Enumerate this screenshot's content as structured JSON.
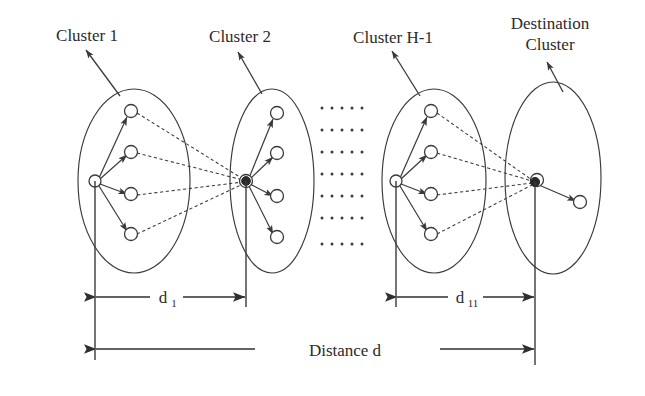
{
  "figure": {
    "width": 645,
    "height": 396,
    "background": "#ffffff",
    "ink": "#3a3a3a"
  },
  "labels": {
    "cluster1": "Cluster 1",
    "cluster2": "Cluster 2",
    "cluster_h1": "Cluster H-1",
    "destination_line1": "Destination",
    "destination_line2": "Cluster"
  },
  "dimensions": {
    "d1_base": "d",
    "d1_sub": "1",
    "d11_base": "d",
    "d11_sub": "11",
    "distance_total": "Distance d"
  },
  "ellipsis": {
    "rows": 7,
    "cols": 5,
    "glyph": "."
  },
  "clusters": [
    {
      "id": "cluster-1",
      "name": "Cluster 1",
      "kind": "source",
      "ellipse": {
        "cx": 134,
        "cy": 181,
        "rx": 56,
        "ry": 92
      },
      "hub": {
        "x": 95,
        "y": 181,
        "type": "open"
      },
      "members": [
        {
          "x": 131,
          "y": 111
        },
        {
          "x": 131,
          "y": 152
        },
        {
          "x": 131,
          "y": 194
        },
        {
          "x": 131,
          "y": 234
        }
      ],
      "ref_line": {
        "x": 95,
        "y_top": 181,
        "y_bottom": 360
      }
    },
    {
      "id": "cluster-2",
      "name": "Cluster 2",
      "kind": "relay",
      "ellipse": {
        "cx": 272,
        "cy": 181,
        "rx": 42,
        "ry": 92
      },
      "hub": {
        "x": 246,
        "y": 181,
        "type": "filled"
      },
      "members": [
        {
          "x": 277,
          "y": 113
        },
        {
          "x": 277,
          "y": 153
        },
        {
          "x": 277,
          "y": 196
        },
        {
          "x": 277,
          "y": 237
        }
      ],
      "ref_line": {
        "x": 246,
        "y_top": 181,
        "y_bottom": 307
      }
    },
    {
      "id": "cluster-h-1",
      "name": "Cluster H-1",
      "kind": "source",
      "ellipse": {
        "cx": 434,
        "cy": 181,
        "rx": 52,
        "ry": 92
      },
      "hub": {
        "x": 396,
        "y": 181,
        "type": "open"
      },
      "members": [
        {
          "x": 431,
          "y": 111
        },
        {
          "x": 431,
          "y": 152
        },
        {
          "x": 431,
          "y": 194
        },
        {
          "x": 431,
          "y": 234
        }
      ],
      "ref_line": {
        "x": 396,
        "y_top": 181,
        "y_bottom": 307
      }
    },
    {
      "id": "destination-cluster",
      "name": "Destination Cluster",
      "kind": "destination",
      "ellipse": {
        "cx": 553,
        "cy": 178,
        "rx": 48,
        "ry": 96
      },
      "hub": {
        "x": 535,
        "y": 182,
        "type": "filled"
      },
      "members": [
        {
          "x": 580,
          "y": 202
        }
      ],
      "ref_line": {
        "x": 535,
        "y_top": 182,
        "y_bottom": 365
      }
    }
  ],
  "dimension_bars": [
    {
      "id": "d1",
      "label": "d1",
      "x_from": 95,
      "x_to": 246,
      "y": 297
    },
    {
      "id": "d11",
      "label": "d11",
      "x_from": 396,
      "x_to": 535,
      "y": 297
    },
    {
      "id": "distance-d",
      "label": "Distance d",
      "x_from": 95,
      "x_to": 535,
      "y": 349
    }
  ],
  "label_pointers": [
    {
      "for": "Cluster 1",
      "from_x": 120,
      "from_y": 96,
      "to_x": 83,
      "to_y": 48
    },
    {
      "for": "Cluster 2",
      "from_x": 262,
      "from_y": 94,
      "to_x": 236,
      "to_y": 50
    },
    {
      "for": "Cluster H-1",
      "from_x": 420,
      "from_y": 96,
      "to_x": 390,
      "to_y": 49
    },
    {
      "for": "Destination Cluster",
      "from_x": 562,
      "from_y": 90,
      "to_x": 545,
      "to_y": 60
    }
  ]
}
